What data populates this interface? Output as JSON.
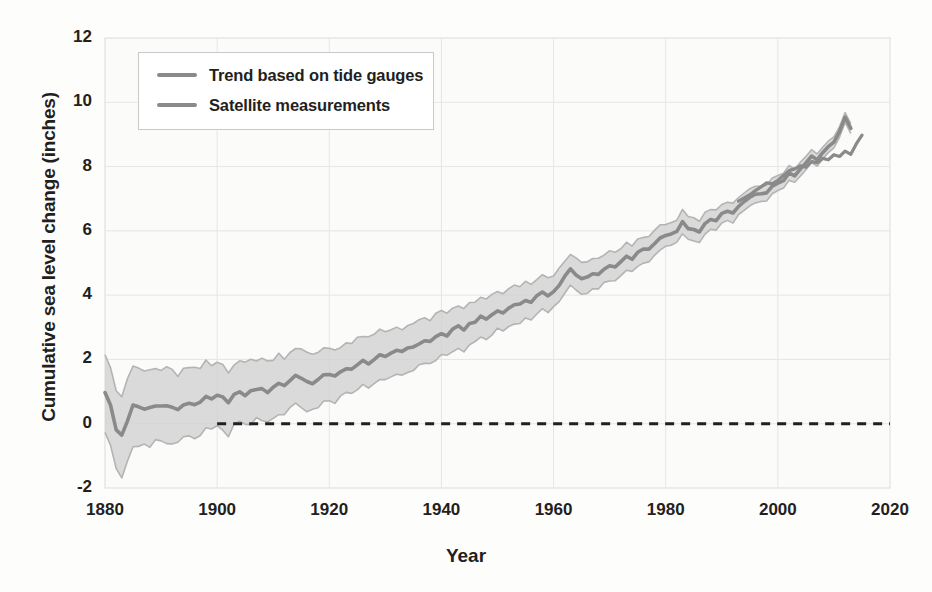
{
  "chart_data": {
    "type": "line",
    "title": "",
    "xlabel": "Year",
    "ylabel": "Cumulative sea level change (inches)",
    "xlim": [
      1880,
      2020
    ],
    "ylim": [
      -2,
      12
    ],
    "xticks": [
      "1880",
      "1900",
      "1920",
      "1940",
      "1960",
      "1980",
      "2000",
      "2020"
    ],
    "yticks": [
      "12",
      "10",
      "8",
      "6",
      "4",
      "2",
      "0",
      "-2"
    ],
    "grid": true,
    "legend_position": "upper-left",
    "zero_reference_line": {
      "value": 0,
      "style": "dashed",
      "start_year": 1900,
      "end_year": 2020
    },
    "colors": {
      "trend_line": "#8a8a8a",
      "uncertainty_band": "#cfcfcf",
      "satellite_line": "#8a8a8a",
      "zero_line": "#231f20"
    },
    "series": [
      {
        "name": "Trend based on tide gauges",
        "x": [
          1880,
          1881,
          1882,
          1883,
          1884,
          1885,
          1886,
          1887,
          1888,
          1889,
          1890,
          1891,
          1892,
          1893,
          1894,
          1895,
          1896,
          1897,
          1898,
          1899,
          1900,
          1901,
          1902,
          1903,
          1904,
          1905,
          1906,
          1907,
          1908,
          1909,
          1910,
          1911,
          1912,
          1913,
          1914,
          1915,
          1916,
          1917,
          1918,
          1919,
          1920,
          1921,
          1922,
          1923,
          1924,
          1925,
          1926,
          1927,
          1928,
          1929,
          1930,
          1931,
          1932,
          1933,
          1934,
          1935,
          1936,
          1937,
          1938,
          1939,
          1940,
          1941,
          1942,
          1943,
          1944,
          1945,
          1946,
          1947,
          1948,
          1949,
          1950,
          1951,
          1952,
          1953,
          1954,
          1955,
          1956,
          1957,
          1958,
          1959,
          1960,
          1961,
          1962,
          1963,
          1964,
          1965,
          1966,
          1967,
          1968,
          1969,
          1970,
          1971,
          1972,
          1973,
          1974,
          1975,
          1976,
          1977,
          1978,
          1979,
          1980,
          1981,
          1982,
          1983,
          1984,
          1985,
          1986,
          1987,
          1988,
          1989,
          1990,
          1991,
          1992,
          1993,
          1994,
          1995,
          1996,
          1997,
          1998,
          1999,
          2000,
          2001,
          2002,
          2003,
          2004,
          2005,
          2006,
          2007,
          2008,
          2009,
          2010,
          2011,
          2012,
          2013
        ],
        "values": [
          1.0,
          0.55,
          -0.2,
          -0.35,
          0.1,
          0.55,
          0.5,
          0.45,
          0.5,
          0.55,
          0.6,
          0.55,
          0.5,
          0.45,
          0.55,
          0.65,
          0.6,
          0.7,
          0.8,
          0.75,
          0.85,
          0.8,
          0.7,
          0.9,
          0.95,
          0.9,
          1.0,
          1.1,
          1.05,
          1.0,
          1.15,
          1.25,
          1.2,
          1.35,
          1.5,
          1.45,
          1.3,
          1.2,
          1.4,
          1.55,
          1.5,
          1.45,
          1.6,
          1.75,
          1.7,
          1.8,
          1.95,
          1.9,
          2.0,
          2.1,
          2.05,
          2.2,
          2.3,
          2.25,
          2.4,
          2.35,
          2.5,
          2.6,
          2.55,
          2.7,
          2.8,
          2.75,
          2.9,
          3.0,
          2.95,
          3.1,
          3.2,
          3.3,
          3.25,
          3.4,
          3.5,
          3.45,
          3.6,
          3.75,
          3.7,
          3.85,
          3.8,
          3.95,
          4.05,
          4.0,
          4.15,
          4.3,
          4.6,
          4.8,
          4.6,
          4.5,
          4.55,
          4.7,
          4.65,
          4.8,
          4.95,
          4.9,
          5.0,
          5.2,
          5.1,
          5.3,
          5.45,
          5.4,
          5.6,
          5.8,
          5.85,
          5.95,
          6.0,
          6.25,
          6.1,
          6.0,
          5.95,
          6.2,
          6.4,
          6.3,
          6.5,
          6.6,
          6.55,
          6.75,
          6.9,
          7.0,
          7.1,
          7.2,
          7.15,
          7.35,
          7.5,
          7.6,
          7.75,
          7.7,
          7.9,
          8.1,
          8.3,
          8.2,
          8.45,
          8.65,
          8.8,
          9.1,
          9.5,
          9.2
        ],
        "band_half_width_start": 1.3,
        "band_half_width_end": 0.15
      },
      {
        "name": "Satellite measurements",
        "x": [
          1993,
          1994,
          1995,
          1996,
          1997,
          1998,
          1999,
          2000,
          2001,
          2002,
          2003,
          2004,
          2005,
          2006,
          2007,
          2008,
          2009,
          2010,
          2011,
          2012,
          2013,
          2014,
          2015
        ],
        "values": [
          6.95,
          7.05,
          7.1,
          7.25,
          7.35,
          7.5,
          7.45,
          7.6,
          7.7,
          7.85,
          7.95,
          8.0,
          8.0,
          8.15,
          8.1,
          8.25,
          8.2,
          8.35,
          8.3,
          8.45,
          8.4,
          8.7,
          9.0
        ]
      }
    ]
  },
  "legend": {
    "items": [
      {
        "label": "Trend based on tide gauges",
        "color": "#8a8a8a"
      },
      {
        "label": "Satellite measurements",
        "color": "#8a8a8a"
      }
    ]
  }
}
